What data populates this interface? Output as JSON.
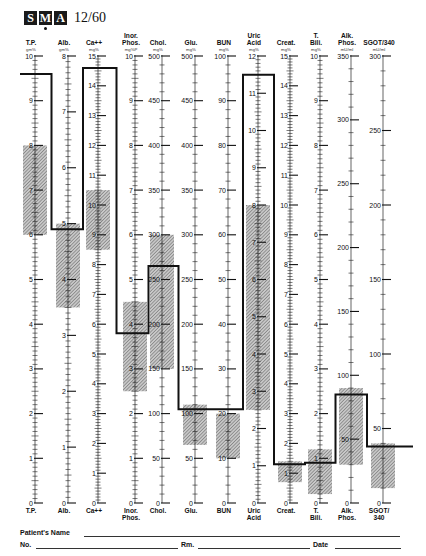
{
  "header": {
    "logo_letters": [
      "S",
      "M",
      "A"
    ],
    "model": "12/60"
  },
  "footer": {
    "patient_name_label": "Patient's Name",
    "number_label": "No.",
    "room_label": "Rm.",
    "date_label": "Date"
  },
  "colors": {
    "ink": "#111111",
    "normal_band": "#9a9a9a",
    "plot_line": "#111111"
  },
  "chart_data": {
    "type": "line",
    "layout": {
      "scale_top_y": 56,
      "scale_zero_y": 503,
      "grid": false,
      "legend": "none"
    },
    "columns": [
      {
        "name": "T.P.",
        "bottom": "T.P.",
        "unit": "gm%",
        "max": 10,
        "major": 1,
        "minor": 10,
        "labels": [
          0,
          1,
          2,
          3,
          4,
          5,
          6,
          7,
          8,
          9,
          10
        ],
        "normal": [
          6,
          8
        ],
        "value": 9.6,
        "x": 35
      },
      {
        "name": "Alb.",
        "bottom": "Alb.",
        "unit": "gm%",
        "max": 8,
        "major": 1,
        "minor": 10,
        "labels": [
          0,
          1,
          2,
          3,
          4,
          5,
          6,
          7,
          8
        ],
        "normal": [
          3.5,
          5
        ],
        "value": 4.9,
        "x": 68
      },
      {
        "name": "Ca++",
        "bottom": "Ca++",
        "unit": "mg%",
        "max": 15,
        "major": 1,
        "minor": 10,
        "labels": [
          0,
          1,
          2,
          3,
          4,
          5,
          6,
          7,
          8,
          9,
          10,
          11,
          12,
          13,
          14,
          15
        ],
        "normal": [
          8.5,
          10.5
        ],
        "value": 14.6,
        "x": 98
      },
      {
        "name": "Inor. Phos.",
        "bottom": "Inor. Phos.",
        "unit": "mg%P",
        "max": 10,
        "major": 1,
        "minor": 10,
        "labels": [
          0,
          1,
          2,
          3,
          4,
          5,
          6,
          7,
          8,
          9,
          10
        ],
        "normal": [
          2.5,
          4.5
        ],
        "value": 3.8,
        "x": 135
      },
      {
        "name": "Chol.",
        "bottom": "Chol.",
        "unit": "mg%",
        "max": 500,
        "major": 50,
        "minor": 5,
        "labels": [
          0,
          50,
          100,
          150,
          200,
          250,
          300,
          350,
          400,
          450,
          500
        ],
        "normal": [
          150,
          300
        ],
        "value": 265,
        "x": 162
      },
      {
        "name": "Glu.",
        "bottom": "Glu.",
        "unit": "mg%",
        "max": 500,
        "major": 50,
        "minor": 5,
        "labels": [
          0,
          50,
          100,
          150,
          200,
          250,
          300,
          350,
          400,
          450,
          500
        ],
        "normal": [
          65,
          110
        ],
        "value": 105,
        "x": 195
      },
      {
        "name": "BUN",
        "bottom": "BUN",
        "unit": "mg%",
        "max": 100,
        "major": 10,
        "minor": 5,
        "labels": [
          0,
          10,
          20,
          30,
          40,
          50,
          60,
          70,
          80,
          90,
          100
        ],
        "normal": [
          10,
          20
        ],
        "value": 21,
        "x": 228
      },
      {
        "name": "Uric Acid",
        "bottom": "Uric Acid",
        "unit": "mg%",
        "max": 12,
        "major": 1,
        "minor": 10,
        "labels": [
          0,
          1,
          2,
          3,
          4,
          5,
          6,
          7,
          8,
          9,
          10,
          11,
          12
        ],
        "normal": [
          2.5,
          8
        ],
        "value": 11.5,
        "x": 258
      },
      {
        "name": "Creat.",
        "bottom": "Creat.",
        "unit": "mg%",
        "max": 15,
        "major": 1,
        "minor": 10,
        "labels": [
          0,
          1,
          2,
          3,
          4,
          5,
          6,
          7,
          8,
          9,
          10,
          11,
          12,
          13,
          14,
          15
        ],
        "normal": [
          0.7,
          1.4
        ],
        "value": 1.3,
        "x": 290
      },
      {
        "name": "T. Bili.",
        "bottom": "T. Bili.",
        "unit": "mg%",
        "max": 10,
        "major": 1,
        "minor": 10,
        "labels": [
          0,
          1,
          2,
          3,
          4,
          5,
          6,
          7,
          8,
          9,
          10
        ],
        "normal": [
          0.2,
          1.2
        ],
        "value": 0.9,
        "x": 320
      },
      {
        "name": "Alk. Phos.",
        "bottom": "Alk. Phos.",
        "unit": "mU/ml",
        "max": 350,
        "major": 50,
        "minor": 5,
        "labels": [
          0,
          50,
          100,
          150,
          200,
          250,
          300,
          350
        ],
        "normal": [
          30,
          90
        ],
        "value": 85,
        "x": 351
      },
      {
        "name": "SGOT/340",
        "bottom": "SGOT/ 340",
        "unit": "mU/ml",
        "max": 300,
        "major": 50,
        "minor": 5,
        "labels": [
          0,
          50,
          100,
          150,
          200,
          250,
          300
        ],
        "normal": [
          10,
          40
        ],
        "value": 38,
        "x": 383
      }
    ],
    "xlabel": "",
    "ylabel": ""
  }
}
